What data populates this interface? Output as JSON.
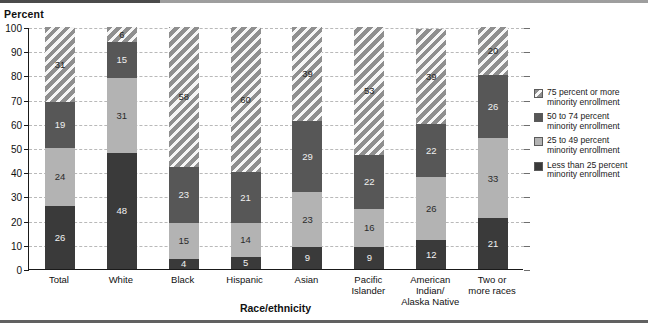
{
  "chart_data": {
    "type": "bar",
    "subtype": "stacked-bar-100",
    "title": "",
    "ylabel": "Percent",
    "xlabel": "Race/ethnicity",
    "ylim": [
      0,
      100
    ],
    "yticks": [
      0,
      10,
      20,
      30,
      40,
      50,
      60,
      70,
      80,
      90,
      100
    ],
    "grid": true,
    "legend_position": "right",
    "categories": [
      "Total",
      "White",
      "Black",
      "Hispanic",
      "Asian",
      "Pacific Islander",
      "American Indian/ Alaska Native",
      "Two or more races"
    ],
    "category_lines": [
      [
        "Total"
      ],
      [
        "White"
      ],
      [
        "Black"
      ],
      [
        "Hispanic"
      ],
      [
        "Asian"
      ],
      [
        "Pacific Islander"
      ],
      [
        "American",
        "Indian/",
        "Alaska Native"
      ],
      [
        "Two or",
        "more races"
      ]
    ],
    "series": [
      {
        "name": "Less than 25 percent minority enrollment",
        "legend_lines": [
          "Less than 25 percent",
          "minority enrollment"
        ],
        "fill": "solid",
        "color": "#3a3a3a",
        "values": [
          26,
          48,
          4,
          5,
          9,
          9,
          12,
          21
        ]
      },
      {
        "name": "25 to 49 percent minority enrollment",
        "legend_lines": [
          "25 to 49 percent",
          "minority enrollment"
        ],
        "fill": "solid",
        "color": "#b3b3b3",
        "values": [
          24,
          31,
          15,
          14,
          23,
          16,
          26,
          33
        ]
      },
      {
        "name": "50 to 74 percent minority enrollment",
        "legend_lines": [
          "50 to 74 percent",
          "minority enrollment"
        ],
        "fill": "solid",
        "color": "#575757",
        "values": [
          19,
          15,
          23,
          21,
          29,
          22,
          22,
          26
        ]
      },
      {
        "name": "75 percent or more minority enrollment",
        "legend_lines": [
          "75 percent or more",
          "minority enrollment"
        ],
        "fill": "hatched",
        "color": "#8f8f8f",
        "values": [
          31,
          6,
          58,
          60,
          39,
          53,
          39,
          20
        ]
      }
    ],
    "legend_order_top_to_bottom": [
      3,
      2,
      1,
      0
    ]
  }
}
